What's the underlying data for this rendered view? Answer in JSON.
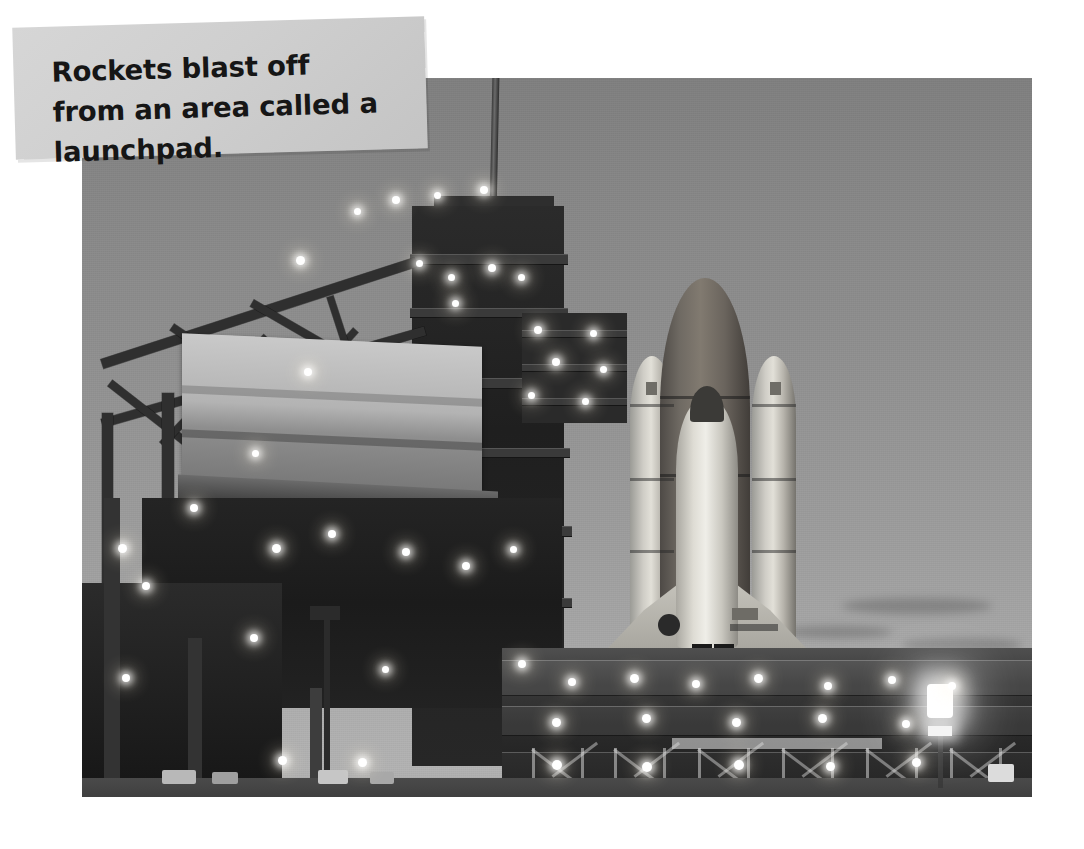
{
  "page": {
    "background_color": "#ffffff",
    "width": 1084,
    "height": 849
  },
  "caption": {
    "text": "Rockets blast off from an area called a launchpad.",
    "background_color": "#d0d0d0",
    "text_color": "#161616",
    "rotation_deg": -1.6
  },
  "photo": {
    "alt": "Space shuttle on the launchpad at dusk with the fixed service structure and floodlights",
    "subject": "space-shuttle-on-launchpad",
    "sky_top_color": "#7f7f7f",
    "sky_horizon_color": "#b2b2b2",
    "structure_color": "#2a2a2a",
    "light_color": "#ffffff",
    "elements": {
      "lightning_mast": "lightning-mast",
      "fixed_service_structure": "fixed-service-structure",
      "rotating_service_structure": "rotating-service-structure",
      "external_tank": "external-tank",
      "solid_rocket_boosters": "solid-rocket-boosters",
      "orbiter": "orbiter",
      "mobile_launcher_platform": "mobile-launcher-platform",
      "floodlight": "floodlight-pole"
    }
  }
}
